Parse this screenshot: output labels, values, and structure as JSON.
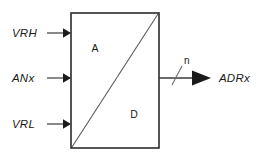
{
  "diagram": {
    "type": "block-diagram",
    "background_color": "#ffffff",
    "line_color": "#2b2b2b",
    "text_color": "#1a1a1a"
  },
  "block": {
    "name": "adc-block",
    "analog_label": "A",
    "digital_label": "D",
    "divider": "diagonal-bottom-left-to-top-right"
  },
  "inputs": [
    {
      "label": "VRH",
      "name": "input-vrh",
      "description": "high reference voltage"
    },
    {
      "label": "ANx",
      "name": "input-anx",
      "description": "analog input channel"
    },
    {
      "label": "VRL",
      "name": "input-vrl",
      "description": "low reference voltage"
    }
  ],
  "output": {
    "label": "ADRx",
    "name": "output-adrx",
    "bus_width_label": "n",
    "description": "n-bit digital result"
  }
}
